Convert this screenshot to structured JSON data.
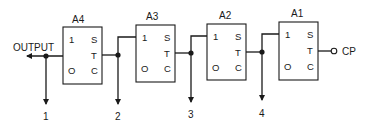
{
  "diagram": {
    "type": "ripple counter / cascaded stages",
    "output_label": "OUTPUT",
    "clock_label": "CP",
    "stages": [
      {
        "id": "A4",
        "pins": {
          "one": "1",
          "zero": "O",
          "s": "S",
          "t": "T",
          "c": "C"
        }
      },
      {
        "id": "A3",
        "pins": {
          "one": "1",
          "zero": "O",
          "s": "S",
          "t": "T",
          "c": "C"
        }
      },
      {
        "id": "A2",
        "pins": {
          "one": "1",
          "zero": "O",
          "s": "S",
          "t": "T",
          "c": "C"
        }
      },
      {
        "id": "A1",
        "pins": {
          "one": "1",
          "zero": "O",
          "s": "S",
          "t": "T",
          "c": "C"
        }
      }
    ],
    "taps": [
      "1",
      "2",
      "3",
      "4"
    ]
  }
}
